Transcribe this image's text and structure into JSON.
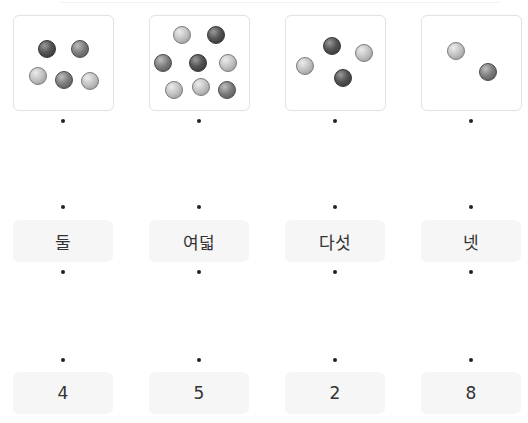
{
  "columns": [
    {
      "box": {
        "left": 13,
        "balls": [
          {
            "x": 33,
            "y": 33,
            "tone": "dark"
          },
          {
            "x": 66,
            "y": 33,
            "tone": "mid"
          },
          {
            "x": 24,
            "y": 60,
            "tone": "light"
          },
          {
            "x": 50,
            "y": 64,
            "tone": "mid"
          },
          {
            "x": 76,
            "y": 65,
            "tone": "light"
          }
        ]
      },
      "word": "둘",
      "number": "4"
    },
    {
      "box": {
        "left": 149,
        "balls": [
          {
            "x": 32,
            "y": 19,
            "tone": "light"
          },
          {
            "x": 66,
            "y": 19,
            "tone": "dark"
          },
          {
            "x": 13,
            "y": 47,
            "tone": "mid"
          },
          {
            "x": 48,
            "y": 47,
            "tone": "dark"
          },
          {
            "x": 78,
            "y": 47,
            "tone": "light"
          },
          {
            "x": 24,
            "y": 74,
            "tone": "light"
          },
          {
            "x": 51,
            "y": 71,
            "tone": "light"
          },
          {
            "x": 77,
            "y": 74,
            "tone": "mid"
          }
        ]
      },
      "word": "여덟",
      "number": "5"
    },
    {
      "box": {
        "left": 285,
        "balls": [
          {
            "x": 46,
            "y": 30,
            "tone": "dark"
          },
          {
            "x": 78,
            "y": 37,
            "tone": "light"
          },
          {
            "x": 19,
            "y": 50,
            "tone": "light"
          },
          {
            "x": 57,
            "y": 62,
            "tone": "dark"
          }
        ]
      },
      "word": "다섯",
      "number": "2"
    },
    {
      "box": {
        "left": 421,
        "balls": [
          {
            "x": 34,
            "y": 35,
            "tone": "light"
          },
          {
            "x": 66,
            "y": 56,
            "tone": "mid"
          }
        ]
      },
      "word": "넷",
      "number": "8"
    }
  ],
  "centers": [
    63,
    199,
    335,
    471
  ],
  "colors": {
    "panel_bg": "#f6f6f6",
    "box_border": "#e2e2e2",
    "dot": "#222222"
  }
}
